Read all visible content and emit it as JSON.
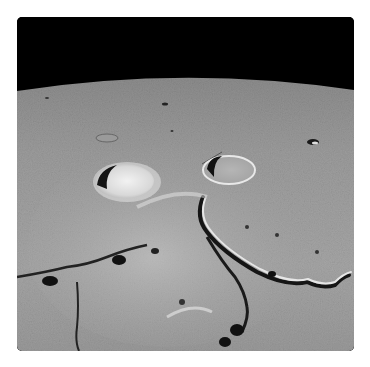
{
  "image": {
    "subject": "lunar surface photograph",
    "alt": "Oblique view of the Moon's surface with black sky above a curved horizon, two prominent craters and a winding rille",
    "colors": {
      "page_background": "#ffffff",
      "sky": "#000000",
      "surface_light": "#b8b8b8",
      "surface_mid": "#8e8e8e",
      "surface_dark": "#5a5a5a",
      "shadow": "#111111",
      "highlight": "#eeeeee"
    }
  }
}
